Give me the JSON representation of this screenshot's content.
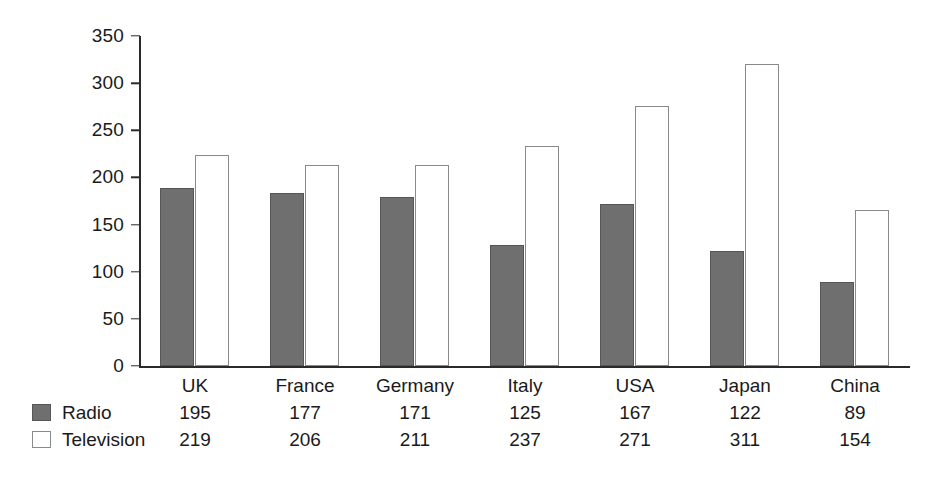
{
  "chart_data": {
    "type": "bar",
    "title": "",
    "xlabel": "",
    "ylabel": "",
    "ylim": [
      0,
      350
    ],
    "ytick_step": 50,
    "yticks": [
      "350",
      "300",
      "250",
      "200",
      "150",
      "100",
      "50",
      "0"
    ],
    "grid": false,
    "legend_position": "bottom-left",
    "categories": [
      "UK",
      "France",
      "Germany",
      "Italy",
      "USA",
      "Japan",
      "China"
    ],
    "series": [
      {
        "name": "Radio",
        "color": "#6f6f6f",
        "values": [
          195,
          177,
          171,
          125,
          167,
          122,
          89
        ],
        "plotted": [
          189,
          183,
          179,
          128,
          172,
          122,
          89
        ]
      },
      {
        "name": "Television",
        "color": "#ffffff",
        "values": [
          219,
          206,
          211,
          237,
          271,
          311,
          154
        ],
        "plotted": [
          224,
          213,
          213,
          233,
          276,
          320,
          166
        ]
      }
    ]
  },
  "legend": {
    "items": [
      {
        "label": "Radio",
        "swatch": "filled-gray-square-icon"
      },
      {
        "label": "Television",
        "swatch": "outlined-white-square-icon"
      }
    ]
  },
  "table": {
    "columns": [
      {
        "category": "UK",
        "radio": "195",
        "television": "219"
      },
      {
        "category": "France",
        "radio": "177",
        "television": "206"
      },
      {
        "category": "Germany",
        "radio": "171",
        "television": "211"
      },
      {
        "category": "Italy",
        "radio": "125",
        "television": "237"
      },
      {
        "category": "USA",
        "radio": "167",
        "television": "271"
      },
      {
        "category": "Japan",
        "radio": "122",
        "television": "311"
      },
      {
        "category": "China",
        "radio": "89",
        "television": "154"
      }
    ]
  },
  "axis": {
    "y_ticks": [
      "350",
      "300",
      "250",
      "200",
      "150",
      "100",
      "50",
      "0"
    ]
  },
  "colors": {
    "radio_fill": "#6f6f6f",
    "radio_stroke": "#565656",
    "television_fill": "#ffffff",
    "television_stroke": "#8a8a8a",
    "axis": "#2a2a2a",
    "text": "#1a1a1a",
    "background": "#ffffff"
  }
}
